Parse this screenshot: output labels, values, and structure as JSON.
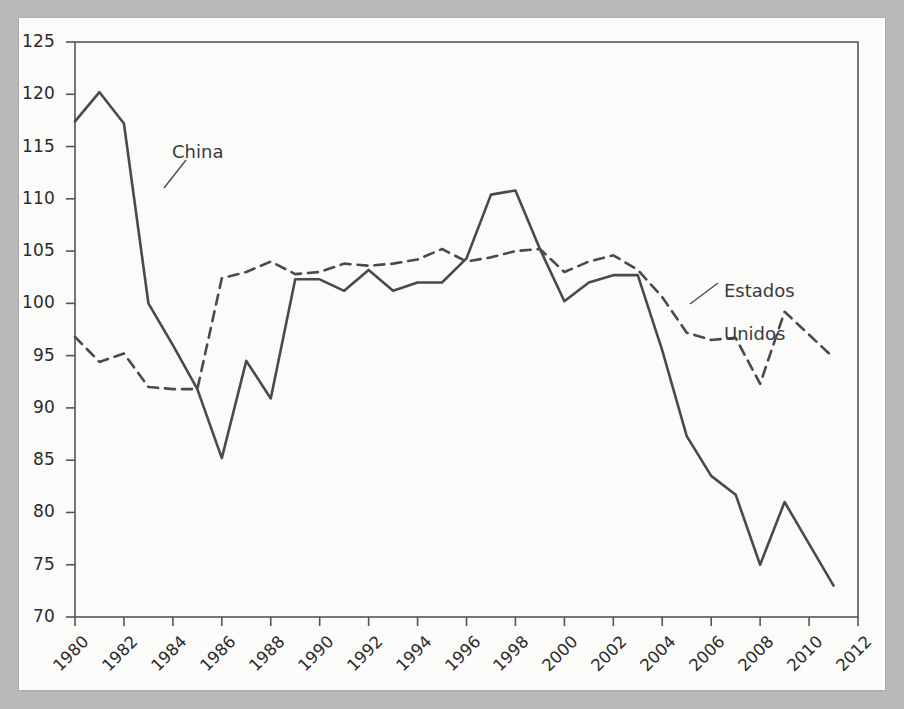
{
  "chart_data": {
    "type": "line",
    "title": "",
    "subtitle": "",
    "xlabel": "",
    "ylabel": "",
    "xlim": [
      1980,
      2012
    ],
    "ylim": [
      70,
      125
    ],
    "grid": false,
    "legend_position": "inline-annotations",
    "xticks": [
      1980,
      1982,
      1984,
      1986,
      1988,
      1990,
      1992,
      1994,
      1996,
      1998,
      2000,
      2002,
      2004,
      2006,
      2008,
      2010,
      2012
    ],
    "yticks": [
      70,
      75,
      80,
      85,
      90,
      95,
      100,
      105,
      110,
      115,
      120,
      125
    ],
    "x": [
      1980,
      1981,
      1982,
      1983,
      1984,
      1985,
      1986,
      1987,
      1988,
      1989,
      1990,
      1991,
      1992,
      1993,
      1994,
      1995,
      1996,
      1997,
      1998,
      1999,
      2000,
      2001,
      2002,
      2003,
      2004,
      2005,
      2006,
      2007,
      2008,
      2009,
      2010,
      2011
    ],
    "series": [
      {
        "name": "China",
        "style": "solid",
        "color": "#4a4a4a",
        "values": [
          117.4,
          120.2,
          117.2,
          100.0,
          96.0,
          91.8,
          85.2,
          94.5,
          90.9,
          102.3,
          102.3,
          101.2,
          103.2,
          101.2,
          102.0,
          102.0,
          104.3,
          110.4,
          110.8,
          105.2,
          100.2,
          102.0,
          102.7,
          102.7,
          95.5,
          87.3,
          83.5,
          81.7,
          75.0,
          81.0,
          77.0,
          73.0
        ]
      },
      {
        "name": "Estados Unidos",
        "style": "dashed",
        "color": "#4a4a4a",
        "values": [
          96.8,
          94.4,
          95.2,
          92.0,
          91.8,
          91.8,
          102.4,
          103.0,
          104.0,
          102.8,
          103.0,
          103.8,
          103.6,
          103.8,
          104.2,
          105.2,
          104.0,
          104.4,
          105.0,
          105.2,
          103.0,
          104.0,
          104.6,
          103.2,
          100.6,
          97.2,
          96.5,
          96.7,
          92.3,
          99.2,
          97.0,
          94.8
        ]
      }
    ],
    "annotations": [
      {
        "text": "China",
        "series": "China"
      },
      {
        "text": "Estados\nUnidos",
        "series": "Estados Unidos"
      }
    ]
  },
  "axis": {
    "y_tick_labels": [
      "125",
      "120",
      "115",
      "110",
      "105",
      "100",
      "95",
      "90",
      "85",
      "80",
      "75",
      "70"
    ],
    "x_tick_labels": [
      "1980",
      "1982",
      "1984",
      "1986",
      "1988",
      "1990",
      "1992",
      "1994",
      "1996",
      "1998",
      "2000",
      "2002",
      "2004",
      "2006",
      "2008",
      "2010",
      "2012"
    ]
  },
  "annotations": {
    "china_label": "China",
    "us_label_line1": "Estados",
    "us_label_line2": "Unidos"
  },
  "colors": {
    "line": "#4a4a4a",
    "frame": "#555555",
    "text": "#2b2b2b",
    "page": "#fbfbfa",
    "backdrop": "#b9b9b7"
  }
}
